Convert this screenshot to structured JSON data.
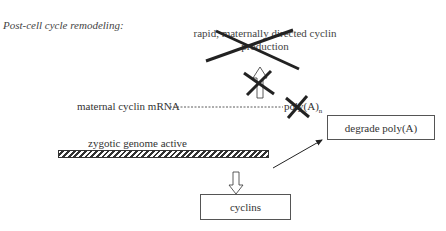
{
  "title": "Post-cell cycle remodeling:",
  "nodes": {
    "rapid_production": "rapid, maternally directed cyclin production",
    "maternal_mrna": "maternal cyclin mRNA",
    "poly_a_tail": "poly(A)",
    "poly_a_subscript": "n",
    "zygotic_genome": "zygotic genome active",
    "degrade_poly_a": "degrade poly(A)",
    "cyclins": "cyclins"
  },
  "states": {
    "rapid_production_blocked": true,
    "arrow_to_production_blocked": true,
    "poly_a_blocked": true
  }
}
